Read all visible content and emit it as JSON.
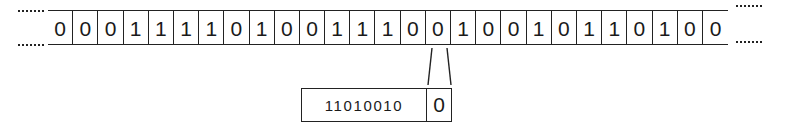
{
  "tape": {
    "leading_ellipsis": "....",
    "trailing_ellipsis": "....",
    "cells": [
      "0",
      "0",
      "0",
      "1",
      "1",
      "1",
      "1",
      "0",
      "1",
      "0",
      "0",
      "1",
      "1",
      "1",
      "0",
      "0",
      "1",
      "0",
      "0",
      "1",
      "0",
      "1",
      "1",
      "0",
      "1",
      "0",
      "0"
    ],
    "highlighted_index": 15
  },
  "extracted": {
    "bits": "11010010",
    "new_bit": "0"
  },
  "colors": {
    "ink": "#222222",
    "background": "#ffffff"
  }
}
